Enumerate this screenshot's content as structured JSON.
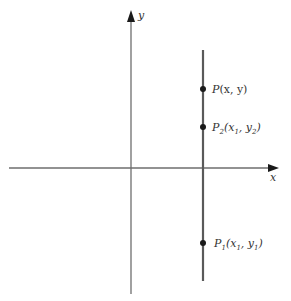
{
  "diagram": {
    "axes": {
      "x_label": "x",
      "y_label": "y",
      "color": "#6e6e6e"
    },
    "vertical_line": {
      "color": "#5a5a5a",
      "description": "vertical line x = x1"
    },
    "points": [
      {
        "id": "P",
        "name": "P",
        "coords": "(x, y)"
      },
      {
        "id": "P2",
        "name": "P",
        "subscript": "2",
        "coords_parts": [
          "(x",
          "1",
          ", y",
          "2",
          ")"
        ]
      },
      {
        "id": "P1",
        "name": "P",
        "subscript": "1",
        "coords_parts": [
          "(x",
          "1",
          ", y",
          "1",
          ")"
        ]
      }
    ],
    "point_color": "#1a1a1a"
  }
}
